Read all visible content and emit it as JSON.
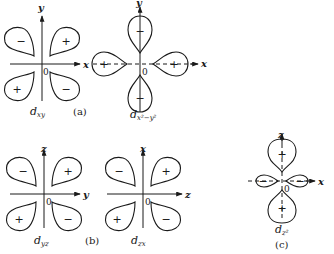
{
  "figure": {
    "panels": [
      {
        "id": "a",
        "label": "(a)",
        "orbitals": [
          {
            "name": "d_xy",
            "base": "d",
            "subscript": "xy",
            "axes": {
              "horizontal": "x",
              "vertical": "y"
            },
            "origin": "0",
            "lobes": [
              {
                "position": "upper-left",
                "sign": "−"
              },
              {
                "position": "upper-right",
                "sign": "+"
              },
              {
                "position": "lower-left",
                "sign": "+"
              },
              {
                "position": "lower-right",
                "sign": "−"
              }
            ]
          },
          {
            "name": "d_x2-y2",
            "base": "d",
            "subscript": "x²−y²",
            "axes": {
              "horizontal": "x",
              "vertical": "y"
            },
            "origin": "0",
            "lobes": [
              {
                "position": "top",
                "sign": "−"
              },
              {
                "position": "bottom",
                "sign": "−"
              },
              {
                "position": "left",
                "sign": "+"
              },
              {
                "position": "right",
                "sign": "+"
              }
            ]
          }
        ]
      },
      {
        "id": "b",
        "label": "(b)",
        "orbitals": [
          {
            "name": "d_yz",
            "base": "d",
            "subscript": "yz",
            "axes": {
              "horizontal": "y",
              "vertical": "z"
            },
            "origin": "0",
            "lobes": [
              {
                "position": "upper-left",
                "sign": "−"
              },
              {
                "position": "upper-right",
                "sign": "+"
              },
              {
                "position": "lower-left",
                "sign": "+"
              },
              {
                "position": "lower-right",
                "sign": "−"
              }
            ]
          },
          {
            "name": "d_zx",
            "base": "d",
            "subscript": "zx",
            "axes": {
              "horizontal": "z",
              "vertical": "x"
            },
            "origin": "0",
            "lobes": [
              {
                "position": "upper-left",
                "sign": "−"
              },
              {
                "position": "upper-right",
                "sign": "+"
              },
              {
                "position": "lower-left",
                "sign": "+"
              },
              {
                "position": "lower-right",
                "sign": "−"
              }
            ]
          }
        ]
      },
      {
        "id": "c",
        "label": "(c)",
        "orbitals": [
          {
            "name": "d_z2",
            "base": "d",
            "subscript": "z²",
            "axes": {
              "horizontal": "x",
              "vertical": "z"
            },
            "origin": "0",
            "lobes": [
              {
                "position": "top",
                "sign": "+"
              },
              {
                "position": "bottom",
                "sign": "+"
              },
              {
                "position": "left-ring",
                "sign": "−"
              },
              {
                "position": "right-ring",
                "sign": "−"
              }
            ]
          }
        ]
      }
    ]
  }
}
